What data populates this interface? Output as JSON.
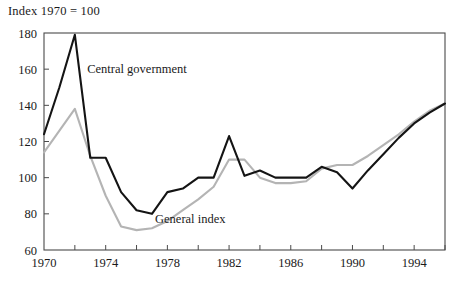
{
  "chart_data": {
    "type": "line",
    "title": "Index 1970 = 100",
    "xlabel": "",
    "ylabel": "",
    "xlim": [
      1970,
      1996
    ],
    "ylim": [
      60,
      180
    ],
    "yticks": [
      60,
      80,
      100,
      120,
      140,
      160,
      180
    ],
    "xticks": [
      1970,
      1972,
      1974,
      1976,
      1978,
      1980,
      1982,
      1984,
      1986,
      1988,
      1990,
      1992,
      1994,
      1996
    ],
    "xtick_labels": [
      "1970",
      "",
      "1974",
      "",
      "1978",
      "",
      "1982",
      "",
      "1986",
      "",
      "1990",
      "",
      "1994",
      ""
    ],
    "xtick_labels_shown": [
      "1970",
      "1974",
      "1978",
      "1982",
      "1986",
      "1990",
      "1994"
    ],
    "ytick_labels": [
      "60",
      "80",
      "100",
      "120",
      "140",
      "160",
      "180"
    ],
    "grid": false,
    "legend_position": "inline-annotations",
    "x": [
      1970,
      1971,
      1972,
      1973,
      1974,
      1975,
      1976,
      1977,
      1978,
      1979,
      1980,
      1981,
      1982,
      1983,
      1984,
      1985,
      1986,
      1987,
      1988,
      1989,
      1990,
      1991,
      1992,
      1993,
      1994,
      1995,
      1996
    ],
    "series": [
      {
        "name": "Central government",
        "color": "#141414",
        "label_x": 1972.8,
        "label_y": 160,
        "values": [
          124,
          150,
          179,
          111,
          111,
          92,
          82,
          80,
          92,
          94,
          100,
          100,
          123,
          101,
          104,
          100,
          100,
          100,
          106,
          103,
          94,
          104,
          113,
          122,
          130,
          136,
          141
        ]
      },
      {
        "name": "General index",
        "color": "#b4b4b4",
        "label_x": 1977.2,
        "label_y": 77,
        "values": [
          114,
          126,
          138,
          112,
          90,
          73,
          71,
          72,
          76,
          82,
          88,
          95,
          110,
          110,
          100,
          97,
          97,
          98,
          105,
          107,
          107,
          112,
          118,
          124,
          131,
          137,
          141
        ]
      }
    ],
    "annotations": [
      {
        "text": "Central government",
        "x": 1972.8,
        "y": 160
      },
      {
        "text": "General index",
        "x": 1977.2,
        "y": 77
      }
    ]
  },
  "plot_geometry": {
    "left": 44,
    "right": 445,
    "top": 33,
    "bottom": 250
  }
}
